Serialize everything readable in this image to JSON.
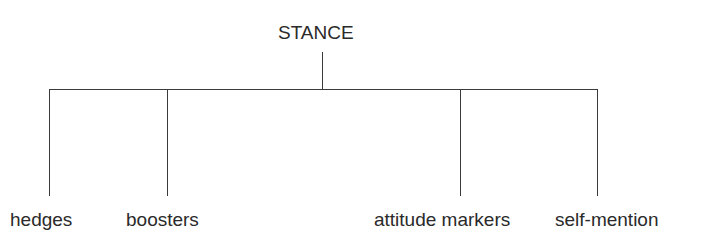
{
  "diagram": {
    "type": "tree",
    "root": {
      "label": "STANCE"
    },
    "children": [
      {
        "label": "hedges"
      },
      {
        "label": "boosters"
      },
      {
        "label": "attitude markers"
      },
      {
        "label": "self-mention"
      }
    ]
  }
}
